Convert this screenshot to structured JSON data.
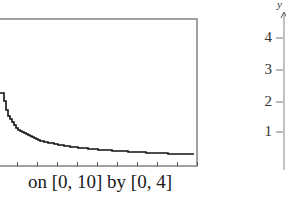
{
  "chart_data": [
    {
      "type": "line",
      "title": "",
      "caption": "on [0, 10] by [0, 4]",
      "xlabel": "",
      "ylabel": "",
      "xlim": [
        0,
        10
      ],
      "ylim": [
        0,
        4
      ],
      "x_ticks": [
        1,
        2,
        3,
        4,
        5,
        6,
        7,
        8,
        9,
        10
      ],
      "grid": false,
      "style": "graphing-calculator viewing window (pixelated staircase curve)",
      "series": [
        {
          "name": "decreasing curve (approx. y = 1/sqrt(x))",
          "x": [
            0.25,
            0.5,
            1,
            2,
            3,
            4,
            5,
            6,
            7,
            8,
            9,
            10
          ],
          "y": [
            2.0,
            1.41,
            1.0,
            0.71,
            0.58,
            0.5,
            0.45,
            0.41,
            0.38,
            0.35,
            0.33,
            0.32
          ]
        }
      ]
    },
    {
      "type": "line",
      "title": "",
      "ylabel": "y",
      "y_ticks": [
        "1",
        "2",
        "3",
        "4"
      ],
      "note": "partially visible second graph; only y-axis with tick labels shown"
    }
  ],
  "caption": "on [0, 10] by [0, 4]",
  "right_axis": {
    "label": "y",
    "ticks": [
      "4",
      "3",
      "2",
      "1"
    ]
  }
}
